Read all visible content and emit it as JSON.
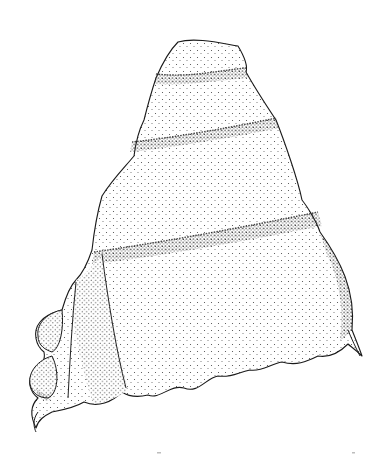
{
  "image": {
    "subject": "stippled pen-and-ink illustration of a gastropod (snail) shell",
    "style": "black stipple dots on white background",
    "background_color": "#ffffff",
    "ink_color": "#1a1a1a",
    "width": 385,
    "height": 457
  },
  "shell": {
    "whorls": [
      "apex",
      "second whorl",
      "third whorl",
      "body whorl"
    ],
    "features": [
      "spiral sutures",
      "wavy outer lip",
      "lobed aperture margin on left",
      "spur on right lower edge",
      "vertical aperture bands"
    ]
  }
}
